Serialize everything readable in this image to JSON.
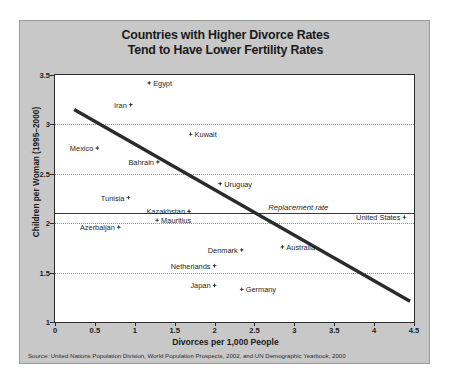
{
  "figure": {
    "title_line1": "Countries with Higher Divorce Rates",
    "title_line2": "Tend to Have Lower Fertility Rates",
    "source": "Source: United Nations Population Division, World Population Prospects, 2002, and UN Demographic Yearbook, 2000",
    "background_color": "#c8c8c8",
    "plot_background_color": "#ffffff",
    "marker_color": "#2b2b2b",
    "gridline_color": "#7d8fa8",
    "trendline_color": "#2b2b2b"
  },
  "chart_data": {
    "type": "scatter",
    "title": "Countries with Higher Divorce Rates Tend to Have Lower Fertility Rates",
    "xlabel": "Divorces per 1,000 People",
    "ylabel": "Children per Woman (1995–2000)",
    "xlim": [
      0,
      4.5
    ],
    "ylim": [
      1,
      3.5
    ],
    "xticks": [
      "0",
      "0.5",
      "1",
      "1.5",
      "2",
      "2.5",
      "3",
      "3.5",
      "4",
      "4.5"
    ],
    "xtick_values": [
      0,
      0.5,
      1,
      1.5,
      2,
      2.5,
      3,
      3.5,
      4,
      4.5
    ],
    "yticks": [
      "1",
      "1.5",
      "2",
      "2.5",
      "3",
      "3.5"
    ],
    "ytick_values": [
      1,
      1.5,
      2,
      2.5,
      3,
      3.5
    ],
    "grid": "horizontal dotted at y = 1.5, 2, 2.5, 3",
    "legend": "none",
    "points": [
      {
        "label": "Egypt",
        "x": 1.18,
        "y": 3.42,
        "label_side": "right"
      },
      {
        "label": "Iran",
        "x": 0.95,
        "y": 3.2,
        "label_side": "left"
      },
      {
        "label": "Mexico",
        "x": 0.53,
        "y": 2.76,
        "label_side": "left"
      },
      {
        "label": "Kuwait",
        "x": 1.7,
        "y": 2.9,
        "label_side": "right"
      },
      {
        "label": "Bahrain",
        "x": 1.29,
        "y": 2.62,
        "label_side": "left"
      },
      {
        "label": "Uruguay",
        "x": 2.07,
        "y": 2.4,
        "label_side": "right"
      },
      {
        "label": "Tunisia",
        "x": 0.92,
        "y": 2.26,
        "label_side": "left"
      },
      {
        "label": "Kazakhstan",
        "x": 1.68,
        "y": 2.12,
        "label_side": "left"
      },
      {
        "label": "Mauritius",
        "x": 1.28,
        "y": 2.03,
        "label_side": "right"
      },
      {
        "label": "Azerbaijan",
        "x": 0.8,
        "y": 1.96,
        "label_side": "left"
      },
      {
        "label": "United States",
        "x": 4.38,
        "y": 2.06,
        "label_side": "left"
      },
      {
        "label": "Denmark",
        "x": 2.34,
        "y": 1.73,
        "label_side": "left"
      },
      {
        "label": "Australia",
        "x": 2.85,
        "y": 1.76,
        "label_side": "right"
      },
      {
        "label": "Netherlands",
        "x": 2.0,
        "y": 1.57,
        "label_side": "left"
      },
      {
        "label": "Japan",
        "x": 2.0,
        "y": 1.37,
        "label_side": "left"
      },
      {
        "label": "Germany",
        "x": 2.34,
        "y": 1.33,
        "label_side": "right"
      }
    ],
    "trendline": {
      "x0": 0.24,
      "y0": 3.15,
      "x1": 4.45,
      "y1": 1.21
    },
    "annotations": [
      {
        "text": "Replacement rate",
        "x": 3.05,
        "y": 2.1,
        "style": "italic"
      }
    ],
    "reference_lines": [
      {
        "label": "Replacement rate",
        "y": 2.1,
        "style": "solid"
      }
    ]
  }
}
